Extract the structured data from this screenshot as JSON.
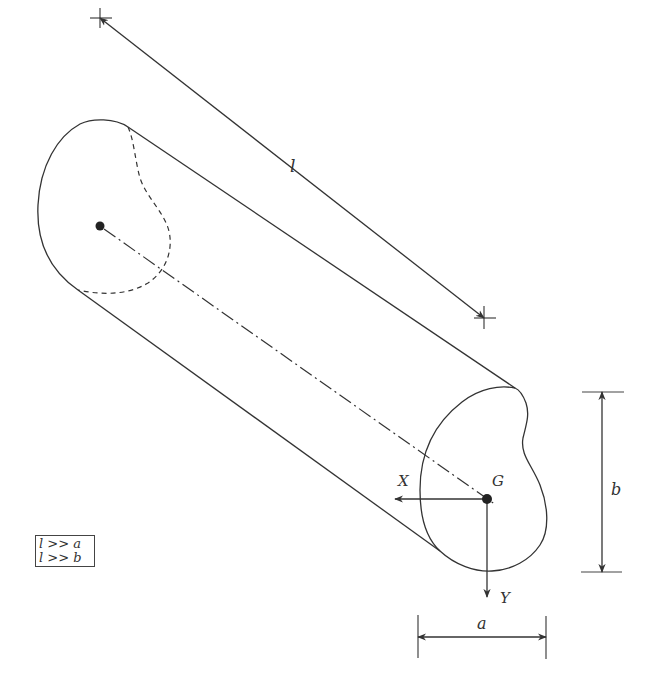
{
  "figure": {
    "labels": {
      "length": "l",
      "centroid": "G",
      "axis_x": "X",
      "axis_y": "Y",
      "width": "a",
      "height": "b"
    },
    "conditions": [
      "l >> a",
      "l >> b"
    ],
    "colors": {
      "line": "#333333",
      "background": "#ffffff"
    }
  }
}
